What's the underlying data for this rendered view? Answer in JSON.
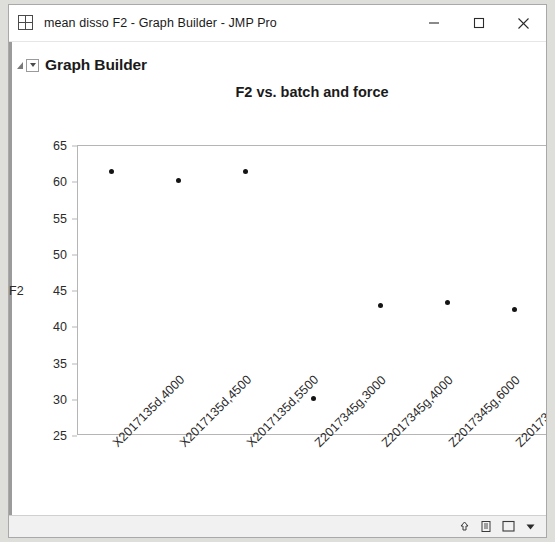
{
  "window": {
    "title": "mean disso F2 - Graph Builder - JMP Pro",
    "app_icon": "data-table-icon",
    "controls": {
      "minimize": "minimize-button",
      "maximize": "maximize-button",
      "close": "close-button"
    }
  },
  "outline": {
    "title": "Graph Builder",
    "disclosure": "disclosure-triangle",
    "menu": "red-triangle-menu"
  },
  "statusbar": {
    "icons": [
      "up-arrow-icon",
      "page-icon",
      "square-icon",
      "dropdown-triangle-icon"
    ]
  },
  "chart_data": {
    "type": "scatter",
    "title": "F2 vs. batch and force",
    "xlabel": "batch and force",
    "ylabel": "F2",
    "ylim": [
      25,
      65
    ],
    "yticks": [
      25,
      30,
      35,
      40,
      45,
      50,
      55,
      60,
      65
    ],
    "grid": false,
    "legend": null,
    "categories": [
      "X2017135d,4000",
      "X2017135d,4500",
      "X2017135d,5500",
      "Z2017345g,3000",
      "Z2017345g,4000",
      "Z2017345g,6000",
      "Z2017345g,7000"
    ],
    "values": [
      61.5,
      60.2,
      61.5,
      30.2,
      43.0,
      43.4,
      42.4
    ],
    "marker": {
      "shape": "circle",
      "color": "#141414",
      "size": 5
    }
  }
}
